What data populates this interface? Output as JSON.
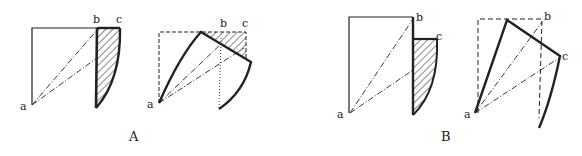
{
  "figure": {
    "panels": [
      {
        "label": "A",
        "subfigures": [
          {
            "name": "A-original",
            "points": {
              "a": "a",
              "b": "b",
              "c": "c"
            }
          },
          {
            "name": "A-deformed",
            "points": {
              "a": "a",
              "b": "b",
              "c": "c"
            }
          }
        ]
      },
      {
        "label": "B",
        "subfigures": [
          {
            "name": "B-original",
            "points": {
              "a": "a",
              "b": "b",
              "c": "c"
            }
          },
          {
            "name": "B-deformed",
            "points": {
              "a": "a",
              "b": "b",
              "c": "c"
            }
          }
        ]
      }
    ],
    "colors": {
      "ink": "#222222",
      "background": "#ffffff"
    }
  }
}
